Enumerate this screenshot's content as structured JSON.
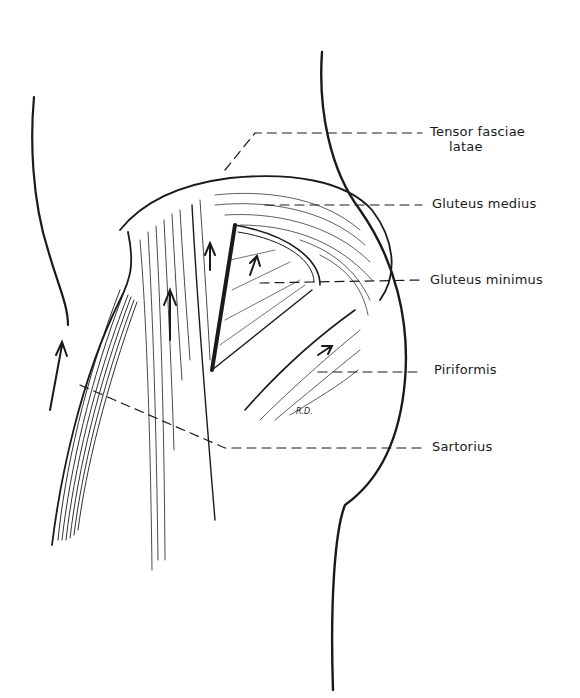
{
  "figure": {
    "type": "anatomical illustration",
    "signature": "R.D.",
    "colors": {
      "ink": "#1a1a1a",
      "background": "#ffffff"
    }
  },
  "labels": [
    {
      "id": "tensor",
      "line1": "Tensor fasciae",
      "line2": "latae"
    },
    {
      "id": "gluteus-medius",
      "text": "Gluteus medius"
    },
    {
      "id": "gluteus-minimus",
      "text": "Gluteus minimus"
    },
    {
      "id": "piriformis",
      "text": "Piriformis"
    },
    {
      "id": "sartorius",
      "text": "Sartorius"
    }
  ]
}
